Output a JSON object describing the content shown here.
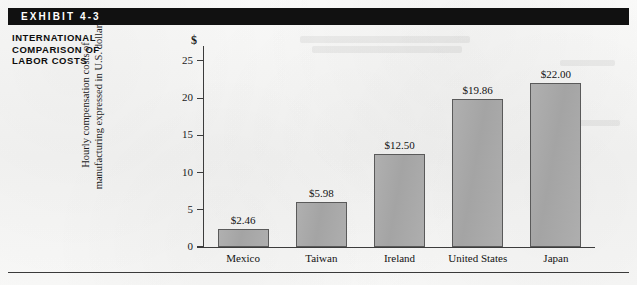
{
  "exhibit": {
    "bar_label": "EXHIBIT 4-3",
    "caption_lines": [
      "INTERNATIONAL",
      "COMPARISON OF",
      "LABOR COSTS"
    ]
  },
  "colors": {
    "header_bar": "#111111",
    "bar_fill": "#a8a8a8",
    "bar_stroke": "#5a5a5a",
    "axis": "#3c3c3c",
    "paper": "#f7f7f6"
  },
  "chart_data": {
    "type": "bar",
    "title": "INTERNATIONAL COMPARISON OF LABOR COSTS",
    "xlabel": "",
    "ylabel": "Hourly compensation costs of manufacturing expressed in U.S. dollars",
    "ylabel_lines": [
      "Hourly compensation costs of",
      "manufacturing expressed in U.S. dollars"
    ],
    "currency_symbol": "$",
    "categories": [
      "Mexico",
      "Taiwan",
      "Ireland",
      "United States",
      "Japan"
    ],
    "values": [
      2.46,
      5.98,
      12.5,
      19.86,
      22.0
    ],
    "value_labels": [
      "$2.46",
      "$5.98",
      "$12.50",
      "$19.86",
      "$22.00"
    ],
    "ylim": [
      0,
      27
    ],
    "yticks": [
      0,
      5,
      10,
      15,
      20,
      25
    ],
    "ytick_labels": [
      "0",
      "5",
      "10",
      "15",
      "20",
      "25"
    ],
    "grid": false,
    "legend": false
  }
}
